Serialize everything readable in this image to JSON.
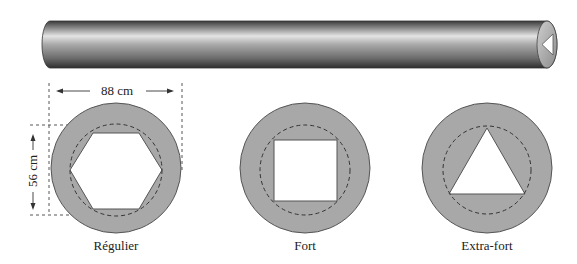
{
  "pipe": {
    "description": "cylindrical pipe with triangular cross-section visible at right end",
    "end_shape": "triangle"
  },
  "dimensions": {
    "width_label": "88 cm",
    "height_label": "56 cm"
  },
  "cross_sections": [
    {
      "label": "Régulier",
      "shape": "hexagon"
    },
    {
      "label": "Fort",
      "shape": "square"
    },
    {
      "label": "Extra-fort",
      "shape": "triangle"
    }
  ],
  "colors": {
    "fill": "#a8a8a8",
    "outline": "#555555",
    "background": "#ffffff"
  }
}
